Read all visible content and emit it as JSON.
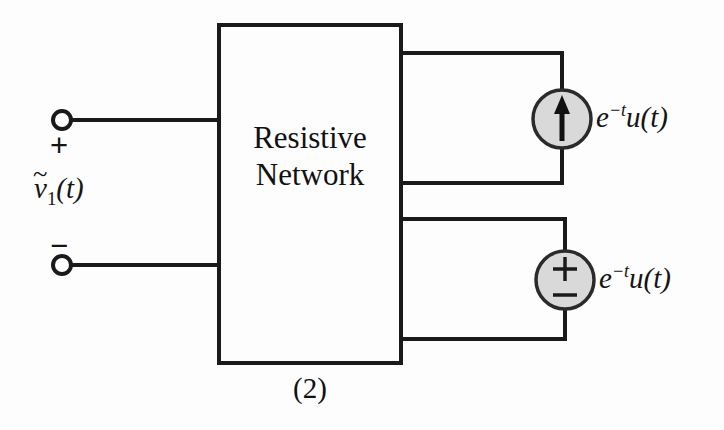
{
  "figure": {
    "caption": "(2)",
    "block_label_line1": "Resistive",
    "block_label_line2": "Network",
    "port_label_base": "v",
    "port_label_tilde": "~",
    "port_label_sub": "1",
    "port_label_arg": "(t)",
    "terminal_plus": "+",
    "terminal_minus": "−",
    "source_plus": "+",
    "source_minus": "−",
    "current_source_label_base": "e",
    "current_source_label_exp": "−t",
    "current_source_label_rest": "u(t)",
    "voltage_source_label_base": "e",
    "voltage_source_label_exp": "−t",
    "voltage_source_label_rest": "u(t)"
  },
  "colors": {
    "background": "#fdfdfd",
    "wire": "#1a1a1a",
    "source_fill": "#d9d9d9",
    "source_stroke": "#2a2a2a",
    "text": "#141414",
    "terminal_fill": "#ffffff"
  }
}
